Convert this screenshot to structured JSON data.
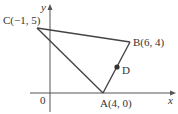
{
  "diagram": {
    "type": "coordinate-geometry",
    "axes": {
      "x_label": "x",
      "y_label": "y",
      "origin_label": "0"
    },
    "points": [
      {
        "id": "A",
        "label": "A(4, 0)",
        "x": 4,
        "y": 0
      },
      {
        "id": "B",
        "label": "B(6, 4)",
        "x": 6,
        "y": 4
      },
      {
        "id": "C",
        "label": "C(−1, 5)",
        "x": -1,
        "y": 5
      },
      {
        "id": "D",
        "label": "D",
        "on_segment": "AB"
      }
    ],
    "segments": [
      [
        "C",
        "B"
      ],
      [
        "B",
        "A"
      ],
      [
        "A",
        "C"
      ]
    ],
    "colors": {
      "line": "#444444",
      "axis": "#555555",
      "point": "#333333"
    }
  }
}
